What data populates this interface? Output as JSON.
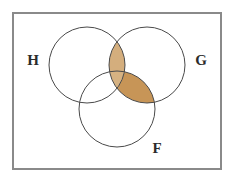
{
  "figure": {
    "name": "venn-diagram",
    "type": "three-set-venn",
    "background_color": "#ffffff"
  },
  "universe": {
    "label": "",
    "shape": "rectangle",
    "border_color": "#8a8a8a",
    "fill_color": "#ffffff",
    "border_width": 2,
    "x": 13,
    "y": 13,
    "width": 208,
    "height": 156
  },
  "sets": [
    {
      "id": "H",
      "label": "H",
      "cx": 87,
      "cy": 65,
      "r": 38,
      "label_x": 33,
      "label_y": 62,
      "stroke_color": "#4a4a4a"
    },
    {
      "id": "G",
      "label": "G",
      "cx": 147,
      "cy": 65,
      "r": 38,
      "label_x": 201,
      "label_y": 62,
      "stroke_color": "#4a4a4a"
    },
    {
      "id": "F",
      "label": "F",
      "cx": 117,
      "cy": 109,
      "r": 38,
      "label_x": 157,
      "label_y": 150,
      "stroke_color": "#4a4a4a"
    }
  ],
  "shading": {
    "fill_color": "#c9a06a",
    "fill_color_deep": "#c79557",
    "fill_color_light": "#d9bb8c",
    "stroke_width": 1,
    "regions": [
      {
        "id": "H-and-G",
        "name": "intersection-h-g",
        "sets": [
          "H",
          "G"
        ],
        "shaded": true,
        "fill": "#d4ae7d"
      },
      {
        "id": "F-and-G",
        "name": "intersection-f-g",
        "sets": [
          "F",
          "G"
        ],
        "shaded": true,
        "fill": "#c79557"
      },
      {
        "id": "H-and-F",
        "name": "intersection-h-f",
        "sets": [
          "H",
          "F"
        ],
        "shaded": false,
        "fill": "#ffffff"
      },
      {
        "id": "H-and-G-and-F",
        "name": "intersection-h-g-f",
        "sets": [
          "H",
          "G",
          "F"
        ],
        "shaded": true,
        "fill": "#d6b282"
      }
    ],
    "expression": "G ∩ (H ∪ F)"
  }
}
